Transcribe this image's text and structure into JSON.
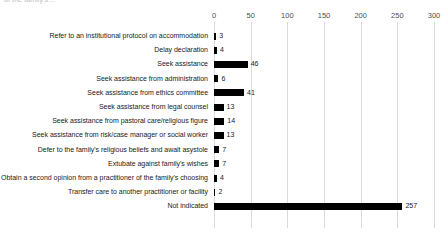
{
  "caption": {
    "clipped_top_left": "of the family’s…",
    "clipped_top_right": " "
  },
  "chart_data": {
    "type": "bar",
    "orientation": "horizontal",
    "title": "",
    "xlabel": "",
    "ylabel": "",
    "xlim": [
      0,
      300
    ],
    "xticks": [
      0,
      50,
      100,
      150,
      200,
      250,
      300
    ],
    "xtick_labels": [
      "0",
      "50",
      "100",
      "150",
      "200",
      "250",
      "300"
    ],
    "grid": true,
    "grid_axis": "x",
    "legend": false,
    "bar_color": "#000000",
    "categories": [
      "Refer to an institutional protocol on accommodation",
      "Delay declaration",
      "Seek assistance",
      "Seek assistance from administration",
      "Seek assistance from ethics committee",
      "Seek assistance from legal counsel",
      "Seek assistance from pastoral care/religious figure",
      "Seek assistance from risk/case manager or social worker",
      "Defer to the family's religious beliefs and await asystole",
      "Extubate against family's wishes",
      "Obtain a second opinion from a practitioner of the family's choosing",
      "Transfer care to another practitioner or facility",
      "Not indicated"
    ],
    "values": [
      3,
      4,
      46,
      6,
      41,
      13,
      14,
      13,
      7,
      7,
      4,
      2,
      257
    ],
    "value_labels": [
      "3",
      "4",
      "46",
      "6",
      "41",
      "13",
      "14",
      "13",
      "7",
      "7",
      "4",
      "2",
      "257"
    ]
  }
}
